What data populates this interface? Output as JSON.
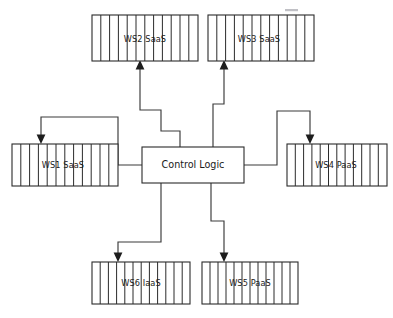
{
  "diagram": {
    "type": "block-diagram",
    "title": "",
    "background_color": "#ffffff",
    "line_color": "#2b2b2b",
    "center_node": {
      "id": "control-logic",
      "label": "Control Logic",
      "shape": "rectangle",
      "striped": false,
      "x": 142,
      "y": 147,
      "width": 102,
      "height": 36
    },
    "nodes": [
      {
        "id": "ws2",
        "label": "WS2 SaaS",
        "shape": "striped-rectangle",
        "striped": true,
        "stripes": 12,
        "x": 92,
        "y": 15,
        "width": 106,
        "height": 46,
        "arrow_entry_edge": "bottom"
      },
      {
        "id": "ws3",
        "label": "WS3 SaaS",
        "shape": "striped-rectangle",
        "striped": true,
        "stripes": 12,
        "x": 208,
        "y": 15,
        "width": 106,
        "height": 46,
        "arrow_entry_edge": "bottom"
      },
      {
        "id": "ws1",
        "label": "WS1 SaaS",
        "shape": "striped-rectangle",
        "striped": true,
        "stripes": 12,
        "x": 12,
        "y": 144,
        "width": 106,
        "height": 42,
        "arrow_entry_edge": "top"
      },
      {
        "id": "ws4",
        "label": "WS4 PaaS",
        "shape": "striped-rectangle",
        "striped": true,
        "stripes": 12,
        "x": 287,
        "y": 144,
        "width": 100,
        "height": 42,
        "arrow_entry_edge": "top"
      },
      {
        "id": "ws6",
        "label": "WS6 IaaS",
        "shape": "striped-rectangle",
        "striped": true,
        "stripes": 12,
        "x": 92,
        "y": 262,
        "width": 98,
        "height": 42,
        "arrow_entry_edge": "top"
      },
      {
        "id": "ws5",
        "label": "WS5 PaaS",
        "shape": "striped-rectangle",
        "striped": true,
        "stripes": 12,
        "x": 202,
        "y": 262,
        "width": 96,
        "height": 42,
        "arrow_entry_edge": "top"
      }
    ],
    "connectors": [
      {
        "id": "control-logic-to-ws2",
        "from": "control-logic",
        "to": "ws2",
        "direction": "outward",
        "style": "orthogonal-staircase",
        "arrowhead": "at-target"
      },
      {
        "id": "control-logic-to-ws3",
        "from": "control-logic",
        "to": "ws3",
        "direction": "outward",
        "style": "orthogonal-staircase",
        "arrowhead": "at-target"
      },
      {
        "id": "control-logic-to-ws1",
        "from": "control-logic",
        "to": "ws1",
        "direction": "outward",
        "style": "orthogonal-staircase",
        "arrowhead": "at-target"
      },
      {
        "id": "control-logic-to-ws4",
        "from": "control-logic",
        "to": "ws4",
        "direction": "outward",
        "style": "orthogonal-staircase",
        "arrowhead": "at-target"
      },
      {
        "id": "control-logic-to-ws6",
        "from": "control-logic",
        "to": "ws6",
        "direction": "outward",
        "style": "orthogonal-staircase",
        "arrowhead": "at-target"
      },
      {
        "id": "control-logic-to-ws5",
        "from": "control-logic",
        "to": "ws5",
        "direction": "outward",
        "style": "orthogonal-staircase",
        "arrowhead": "at-target"
      }
    ]
  }
}
